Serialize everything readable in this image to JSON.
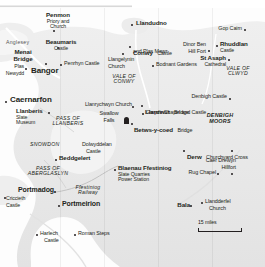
{
  "map": {
    "title": "North Wales",
    "scale": {
      "label": "15 miles"
    },
    "colors": {
      "land": "#e8e8e8",
      "land_light": "#f2f2f2",
      "sea": "#fbfbfb",
      "text": "#231f20"
    },
    "regions": [
      {
        "id": "anglesey",
        "label": "Anglesey",
        "x": 16,
        "y": 41
      },
      {
        "id": "vale-of-conwy",
        "label": "VALE OF\nCONWY",
        "x": 118,
        "y": 78
      },
      {
        "id": "vale-of-clwyd",
        "label": "VALE OF\nCLWYD",
        "x": 226,
        "y": 68
      },
      {
        "id": "denbigh-moors",
        "label": "DENBIGH\nMOORS",
        "x": 198,
        "y": 117
      },
      {
        "id": "pass-of-llanberis",
        "label": "PASS OF\nLLANBERIS",
        "x": 57,
        "y": 117
      },
      {
        "id": "snowdon",
        "label": "SNOWDON",
        "x": 42,
        "y": 143
      },
      {
        "id": "pass-of-aberglaslyn",
        "label": "PASS OF\nABERGLASLYN",
        "x": 40,
        "y": 169
      },
      {
        "id": "ffestiniog-railway",
        "label": "Ffestiniog\nRailway",
        "x": 78,
        "y": 186
      }
    ],
    "places": [
      {
        "id": "penmon",
        "name": "Penmon",
        "sub": "Priory and\nChurch",
        "x": 58,
        "y": 15,
        "marker": "dot",
        "align": "center"
      },
      {
        "id": "llandudno",
        "name": "Llandudno",
        "sub": "",
        "x": 136,
        "y": 22,
        "marker": "dot",
        "align": "left"
      },
      {
        "id": "beaumaris",
        "name": "Beaumaris",
        "sub": "Castle",
        "x": 61,
        "y": 40,
        "marker": "dot",
        "align": "center"
      },
      {
        "id": "great-orme",
        "name": "Gop Cairn",
        "sub": "",
        "x": 222,
        "y": 28,
        "marker": "dot",
        "align": "right"
      },
      {
        "id": "conwy",
        "name": "Conwy",
        "sub": "Castle",
        "x": 133,
        "y": 44,
        "marker": "dot",
        "align": "left"
      },
      {
        "id": "plas-mawr",
        "name": "and Plas Mawr",
        "sub": "",
        "x": 136,
        "y": 50,
        "marker": "none",
        "align": "left"
      },
      {
        "id": "rhuddlan",
        "name": "Rhuddlan",
        "sub": "Castle",
        "x": 220,
        "y": 43,
        "marker": "dot",
        "align": "left"
      },
      {
        "id": "dinas-bran",
        "name": "Dinor Ben",
        "sub": "Hill Fort",
        "x": 186,
        "y": 44,
        "marker": "dot",
        "align": "right"
      },
      {
        "id": "menai-bridge",
        "name": "Menai\nBridge",
        "sub": "",
        "x": 22,
        "y": 52,
        "marker": "none",
        "align": "center"
      },
      {
        "id": "penrhyn-castle",
        "name": "Penrhyn Castle",
        "sub": "",
        "x": 64,
        "y": 62,
        "marker": "dot",
        "align": "left"
      },
      {
        "id": "llangelynin",
        "name": "Llangelynin",
        "sub": "Church",
        "x": 108,
        "y": 58,
        "marker": "dot",
        "align": "left"
      },
      {
        "id": "bodnant",
        "name": "Bodnant Gardens",
        "sub": "",
        "x": 156,
        "y": 63,
        "marker": "dot",
        "align": "left"
      },
      {
        "id": "st-asaph",
        "name": "St Asaph",
        "sub": "Cathedral",
        "x": 202,
        "y": 57,
        "marker": "dot",
        "align": "right"
      },
      {
        "id": "plas-newydd",
        "name": "Plas",
        "sub": "Newydd",
        "x": 10,
        "y": 66,
        "marker": "dot",
        "align": "left"
      },
      {
        "id": "bangor",
        "name": "Bangor",
        "sub": "",
        "x": 46,
        "y": 68,
        "marker": "dot",
        "align": "center"
      },
      {
        "id": "caernarfon",
        "name": "Caernarfon",
        "sub": "",
        "x": 10,
        "y": 99,
        "marker": "dot",
        "align": "left"
      },
      {
        "id": "llanrychwyn",
        "name": "Llanrychwyn Church",
        "sub": "",
        "x": 86,
        "y": 104,
        "marker": "dot",
        "align": "left"
      },
      {
        "id": "llanrwst",
        "name": "Llanrwst",
        "sub": "Bridge",
        "x": 145,
        "y": 103,
        "marker": "dot",
        "align": "left"
      },
      {
        "id": "denbigh-castle",
        "name": "Denbigh Castle",
        "sub": "",
        "x": 198,
        "y": 96,
        "marker": "dot",
        "align": "right"
      },
      {
        "id": "gwydir",
        "name": "Gwydir Chapel and Castle",
        "sub": "",
        "x": 146,
        "y": 111,
        "marker": "dot",
        "align": "left"
      },
      {
        "id": "llanberis",
        "name": "Llanberis",
        "sub": "Slate\nMuseum",
        "x": 16,
        "y": 110,
        "marker": "dot",
        "align": "left"
      },
      {
        "id": "swallow-falls",
        "name": "Swallow",
        "sub": "Falls",
        "x": 106,
        "y": 113,
        "marker": "none",
        "align": "center"
      },
      {
        "id": "betws-y-coed",
        "name": "Betws-y-coed",
        "sub": "Bridge",
        "x": 134,
        "y": 121,
        "marker": "castle",
        "align": "left"
      },
      {
        "id": "dolwyddelan",
        "name": "Dolwyddelan",
        "sub": "Castle",
        "x": 82,
        "y": 144,
        "marker": "none",
        "align": "left"
      },
      {
        "id": "derw",
        "name": "Derw",
        "sub": "Churchyard Cross",
        "x": 187,
        "y": 148,
        "marker": "dot",
        "align": "left"
      },
      {
        "id": "caer-drewyn",
        "name": "Caer Drewyn",
        "sub": "Hillfort",
        "x": 232,
        "y": 160,
        "marker": "dot",
        "align": "right"
      },
      {
        "id": "beddgelert",
        "name": "Beddgelert",
        "sub": "",
        "x": 59,
        "y": 157,
        "marker": "dot",
        "align": "left"
      },
      {
        "id": "blaenau",
        "name": "Blaenau Ffestiniog",
        "sub": "Slate Quarries\nPower Station",
        "x": 118,
        "y": 167,
        "marker": "dot",
        "align": "left"
      },
      {
        "id": "rug-chapel",
        "name": "Rug  Chapel",
        "sub": "",
        "x": 206,
        "y": 172,
        "marker": "dot",
        "align": "right"
      },
      {
        "id": "portmadog",
        "name": "Portmadog",
        "sub": "",
        "x": 18,
        "y": 189,
        "marker": "dot",
        "align": "left"
      },
      {
        "id": "criccieth",
        "name": "Criccieth",
        "sub": "Castle",
        "x": 6,
        "y": 199,
        "marker": "dot",
        "align": "left"
      },
      {
        "id": "portmeirion",
        "name": "Portmeirion",
        "sub": "",
        "x": 62,
        "y": 203,
        "marker": "dot",
        "align": "left"
      },
      {
        "id": "bala",
        "name": "Bala",
        "sub": "",
        "x": 176,
        "y": 203,
        "marker": "dot",
        "align": "left"
      },
      {
        "id": "llandderfel",
        "name": "Llandderfel",
        "sub": "Church",
        "x": 205,
        "y": 200,
        "marker": "dot",
        "align": "left"
      },
      {
        "id": "harlech",
        "name": "Harlech",
        "sub": "Castle",
        "x": 40,
        "y": 232,
        "marker": "dot",
        "align": "left"
      },
      {
        "id": "roman-steps",
        "name": "Roman Steps",
        "sub": "",
        "x": 78,
        "y": 232,
        "marker": "dot",
        "align": "left"
      }
    ]
  }
}
